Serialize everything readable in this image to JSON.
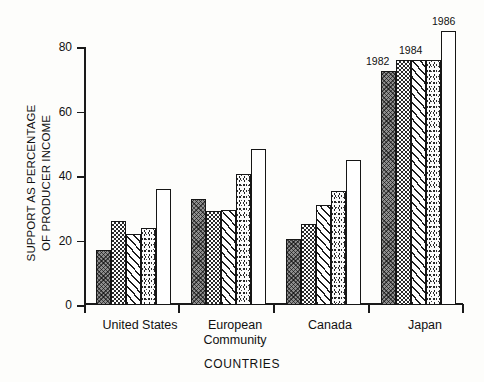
{
  "chart_data": {
    "type": "bar",
    "title": "",
    "xlabel": "COUNTRIES",
    "ylabel": "SUPPORT AS PERCENTAGE\nOF PRODUCER INCOME",
    "categories": [
      "United States",
      "European\nCommunity",
      "Canada",
      "Japan"
    ],
    "series": [
      {
        "name": "1982",
        "values": [
          17,
          33,
          20.5,
          72.5
        ]
      },
      {
        "name": "1983",
        "values": [
          26,
          29,
          25,
          76
        ]
      },
      {
        "name": "1984",
        "values": [
          22,
          29.5,
          31,
          76
        ]
      },
      {
        "name": "1985",
        "values": [
          24,
          40.5,
          35.5,
          76
        ]
      },
      {
        "name": "1986",
        "values": [
          36,
          48.5,
          45,
          85
        ]
      }
    ],
    "ylim": [
      0,
      88
    ],
    "yticks": [
      0,
      20,
      40,
      60,
      80
    ],
    "ytick_labels": [
      "0",
      "20",
      "40",
      "60",
      "80"
    ],
    "grid": false,
    "legend": "none",
    "annotations": [
      {
        "text": "1982",
        "series": 0,
        "category": "Japan"
      },
      {
        "text": "1984",
        "series": 2,
        "category": "Japan"
      },
      {
        "text": "1986",
        "series": 4,
        "category": "Japan"
      }
    ],
    "patterns": [
      "crosshatch",
      "checker",
      "diagonal",
      "stipple",
      "white"
    ]
  },
  "axis": {
    "y_label_text": "SUPPORT AS PERCENTAGE\nOF PRODUCER INCOME",
    "x_label_text": "COUNTRIES",
    "tick_80": "80",
    "tick_60": "60",
    "tick_40": "40",
    "tick_20": "20",
    "tick_0": "0"
  },
  "categories": {
    "c0": "United States",
    "c1": "European\nCommunity",
    "c2": "Canada",
    "c3": "Japan"
  },
  "year_labels": {
    "y1982": "1982",
    "y1984": "1984",
    "y1986": "1986"
  },
  "colors": {
    "ink": "#161616",
    "page": "#fdfdfb",
    "bar_dark": "#8e8e8e"
  }
}
